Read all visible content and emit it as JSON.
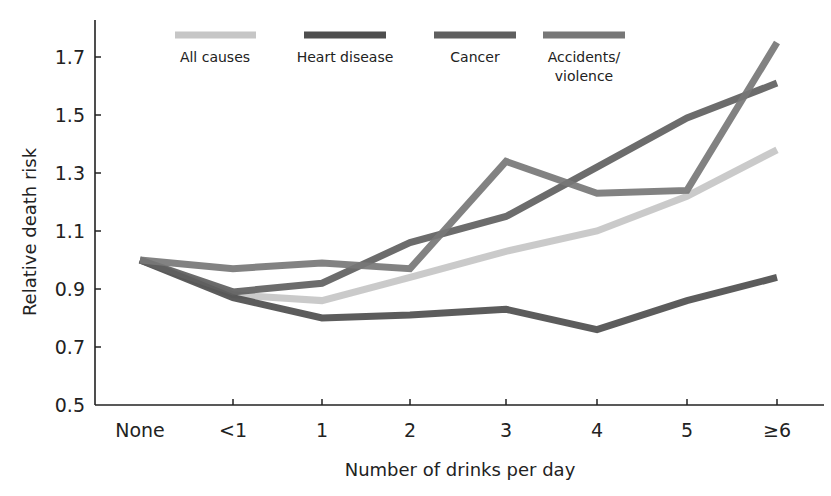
{
  "chart_data": {
    "type": "line",
    "title": "",
    "xlabel": "Number of drinks per day",
    "ylabel": "Relative death risk",
    "categories": [
      "None",
      "<1",
      "1",
      "2",
      "3",
      "4",
      "5",
      "≥6"
    ],
    "yticks": [
      "0.5",
      "0.7",
      "0.9",
      "1.1",
      "1.3",
      "1.5",
      "1.7"
    ],
    "ylim": [
      0.5,
      1.77
    ],
    "grid": false,
    "legend_position": "top",
    "series": [
      {
        "name": "All causes",
        "color": "#c6c6c6",
        "values": [
          1.0,
          0.88,
          0.86,
          0.94,
          1.03,
          1.1,
          1.22,
          1.38
        ]
      },
      {
        "name": "Heart disease",
        "color": "#4e4e4e",
        "values": [
          1.0,
          0.87,
          0.8,
          0.81,
          0.83,
          0.76,
          0.86,
          0.94
        ]
      },
      {
        "name": "Cancer",
        "color": "#5f5f5f",
        "values": [
          1.0,
          0.89,
          0.92,
          1.06,
          1.15,
          1.32,
          1.49,
          1.61
        ]
      },
      {
        "name": "Accidents/\nviolence",
        "color": "#777777",
        "values": [
          1.0,
          0.97,
          0.99,
          0.97,
          1.34,
          1.23,
          1.24,
          1.75
        ]
      }
    ]
  },
  "legend": {
    "all_causes": "All causes",
    "heart_disease": "Heart disease",
    "cancer": "Cancer",
    "accidents_line1": "Accidents/",
    "accidents_line2": "violence"
  },
  "axes": {
    "x_title": "Number of drinks per day",
    "y_title": "Relative death risk"
  }
}
